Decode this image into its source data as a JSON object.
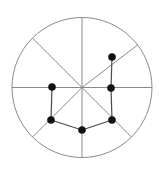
{
  "figure": {
    "title": "",
    "background_color": "#ffffff",
    "width": 164,
    "height": 175
  },
  "boundary": {
    "shape": "circle",
    "center_x": 82,
    "center_y": 87.5,
    "radius": 70,
    "stroke_color": "#8a8a8a",
    "stroke_width": 1,
    "fill": "none"
  },
  "spokes": {
    "stroke_color": "#8a8a8a",
    "stroke_width": 1,
    "count": 8,
    "hub_x": 82,
    "hub_y": 87.5,
    "endpoints": [
      {
        "name": "spoke-north",
        "x": 82,
        "y": 17.5
      },
      {
        "name": "spoke-northeast",
        "x": 137.5,
        "y": 45
      },
      {
        "name": "spoke-east",
        "x": 152,
        "y": 87.5
      },
      {
        "name": "spoke-southeast",
        "x": 131.5,
        "y": 137
      },
      {
        "name": "spoke-south",
        "x": 82,
        "y": 157.5
      },
      {
        "name": "spoke-southwest",
        "x": 32.5,
        "y": 137
      },
      {
        "name": "spoke-west",
        "x": 12,
        "y": 87.5
      },
      {
        "name": "spoke-northwest",
        "x": 32.5,
        "y": 38
      }
    ]
  },
  "nodes": {
    "radius": 3.6,
    "fill_color": "#111111",
    "stroke_color": "#111111",
    "items": [
      {
        "id": "n1",
        "name": "node-upper-right",
        "x": 112,
        "y": 57
      },
      {
        "id": "n2",
        "name": "node-right",
        "x": 111,
        "y": 88
      },
      {
        "id": "n3",
        "name": "node-left",
        "x": 52,
        "y": 87
      },
      {
        "id": "n4",
        "name": "node-lower-left",
        "x": 51,
        "y": 120
      },
      {
        "id": "n5",
        "name": "node-bottom-center",
        "x": 82,
        "y": 130
      },
      {
        "id": "n6",
        "name": "node-lower-right",
        "x": 112,
        "y": 120
      },
      {
        "id": "n7",
        "name": "node-hub-center",
        "x": 82,
        "y": 87.5
      }
    ]
  },
  "edges": {
    "stroke_color": "#4a4a4a",
    "stroke_width": 1.2,
    "items": [
      {
        "name": "edge-upper-right-to-right",
        "from": "n1",
        "to": "n2"
      },
      {
        "name": "edge-right-to-lower-right",
        "from": "n2",
        "to": "n6"
      },
      {
        "name": "edge-lower-right-to-bottom-center",
        "from": "n6",
        "to": "n5"
      },
      {
        "name": "edge-bottom-center-to-lower-left",
        "from": "n5",
        "to": "n4"
      },
      {
        "name": "edge-lower-left-to-left",
        "from": "n4",
        "to": "n3"
      }
    ]
  }
}
